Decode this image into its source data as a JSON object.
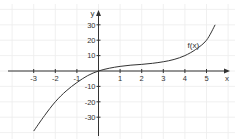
{
  "colors": {
    "background": "#ffffff",
    "grid": "#ececec",
    "axis": "#333333",
    "curve": "#333333",
    "text": "#333333"
  },
  "chart_data": {
    "type": "line",
    "title": "",
    "xlabel": "x",
    "ylabel": "y",
    "xlim": [
      -4.1,
      6.1
    ],
    "ylim": [
      -40,
      39
    ],
    "grid": true,
    "legend": null,
    "x_ticks": [
      -3,
      -2,
      -1,
      1,
      2,
      3,
      4,
      5
    ],
    "x_tick_labels": [
      "-3",
      "-2",
      "-1",
      "1",
      "2",
      "3",
      "4",
      "5"
    ],
    "y_ticks": [
      30,
      20,
      10,
      -10,
      -20,
      -30
    ],
    "y_tick_labels": [
      "30",
      "20",
      "10",
      "-10",
      "-20",
      "-30"
    ],
    "series": [
      {
        "name": "f(x)",
        "x": [
          -3.0,
          -2.5,
          -2.0,
          -1.5,
          -1.0,
          -0.5,
          0.0,
          0.5,
          1.0,
          1.5,
          2.0,
          2.5,
          3.0,
          3.5,
          4.0,
          4.5,
          5.0,
          5.4
        ],
        "values": [
          -39,
          -29,
          -20,
          -13,
          -7.5,
          -3,
          0,
          1.8,
          3,
          3.8,
          4.3,
          5,
          6,
          7.5,
          10,
          14,
          20,
          30
        ]
      }
    ],
    "annotations": [
      {
        "text": "f(x)",
        "x": 4.4,
        "y": 17
      }
    ]
  }
}
